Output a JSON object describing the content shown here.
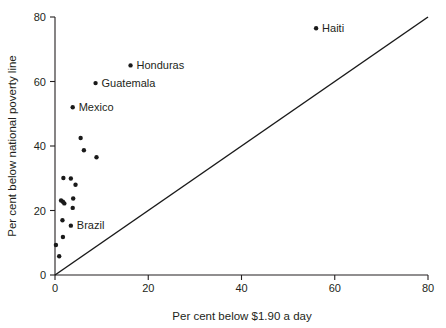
{
  "chart_data": {
    "type": "scatter",
    "title": "",
    "xlabel": "Per cent below $1.90 a day",
    "ylabel": "Per cent below national poverty line",
    "xlim": [
      0,
      80
    ],
    "ylim": [
      0,
      80
    ],
    "xticks": [
      "0",
      "20",
      "40",
      "60",
      "80"
    ],
    "xtick_values": [
      0,
      20,
      40,
      60,
      80
    ],
    "yticks": [
      "0",
      "20",
      "40",
      "60",
      "80"
    ],
    "ytick_values": [
      0,
      20,
      40,
      60,
      80
    ],
    "grid": false,
    "legend": "none",
    "reference_line": {
      "name": "identity-line",
      "from": [
        0,
        0
      ],
      "to": [
        80,
        80
      ],
      "description": "45 degree line y = x"
    },
    "points": [
      {
        "label": "Haiti",
        "x": 56.0,
        "y": 76.5,
        "labeled": true
      },
      {
        "label": "Honduras",
        "x": 16.2,
        "y": 65.0,
        "labeled": true
      },
      {
        "label": "Guatemala",
        "x": 8.7,
        "y": 59.5,
        "labeled": true
      },
      {
        "label": "Mexico",
        "x": 3.8,
        "y": 52.0,
        "labeled": true
      },
      {
        "label": "",
        "x": 5.5,
        "y": 42.5,
        "labeled": false
      },
      {
        "label": "",
        "x": 6.2,
        "y": 38.7,
        "labeled": false
      },
      {
        "label": "",
        "x": 8.9,
        "y": 36.5,
        "labeled": false
      },
      {
        "label": "",
        "x": 1.8,
        "y": 30.1,
        "labeled": false
      },
      {
        "label": "",
        "x": 3.4,
        "y": 29.9,
        "labeled": false
      },
      {
        "label": "",
        "x": 4.4,
        "y": 28.0,
        "labeled": false
      },
      {
        "label": "",
        "x": 3.9,
        "y": 23.7,
        "labeled": false
      },
      {
        "label": "",
        "x": 1.3,
        "y": 23.1,
        "labeled": false
      },
      {
        "label": "",
        "x": 1.7,
        "y": 22.7,
        "labeled": false
      },
      {
        "label": "",
        "x": 2.0,
        "y": 22.2,
        "labeled": false
      },
      {
        "label": "",
        "x": 3.8,
        "y": 20.8,
        "labeled": false
      },
      {
        "label": "",
        "x": 1.6,
        "y": 17.0,
        "labeled": false
      },
      {
        "label": "Brazil",
        "x": 3.4,
        "y": 15.3,
        "labeled": true
      },
      {
        "label": "",
        "x": 1.7,
        "y": 11.8,
        "labeled": false
      },
      {
        "label": "",
        "x": 0.2,
        "y": 9.3,
        "labeled": false
      },
      {
        "label": "",
        "x": 0.9,
        "y": 5.8,
        "labeled": false
      }
    ]
  },
  "colors": {
    "background": "#ffffff",
    "axis": "#231f20",
    "point": "#1a1a1a",
    "reference_line": "#1a1a1a",
    "text": "#231f20"
  }
}
